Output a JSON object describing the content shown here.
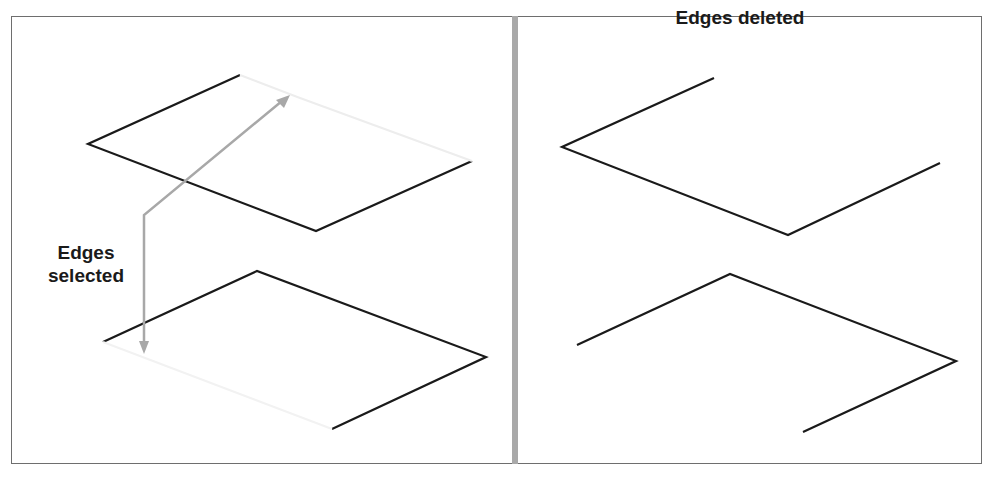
{
  "panels": {
    "left": {
      "label_line1": "Edges",
      "label_line2": "selected",
      "state": "edges-selected"
    },
    "right": {
      "label": "Edges deleted",
      "state": "edges-deleted"
    }
  },
  "colors": {
    "edge": "#1a1a1a",
    "arrow": "#a8a8a8",
    "divider": "#a9a9a9",
    "frame": "#6e6e6e"
  }
}
